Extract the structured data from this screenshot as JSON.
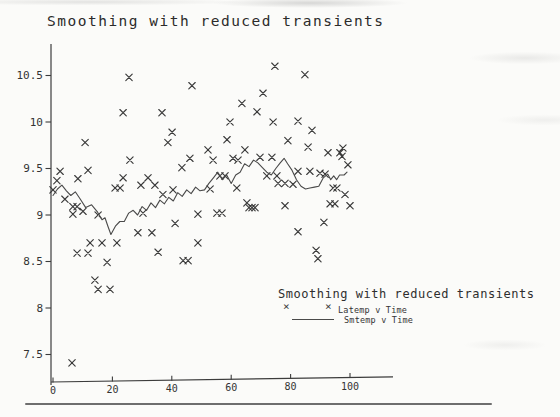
{
  "title": "Smoothing with reduced transients",
  "icons": {
    "x_marker_glyph": "×"
  },
  "colors": {
    "paper": "#fbfbf9",
    "ink": "#2b2b2b",
    "axis": "#3c3c3c",
    "marker": "#3a3a3a",
    "line": "#4a4a4a",
    "page_rule": "#6e6e6e"
  },
  "chart_data": {
    "type": "scatter",
    "title": "Smoothing with reduced transients",
    "xlabel": "",
    "ylabel": "",
    "xlim": [
      0,
      114
    ],
    "ylim": [
      7.2,
      10.95
    ],
    "x_ticks": [
      0,
      20,
      40,
      60,
      80,
      100
    ],
    "y_ticks": [
      7.5,
      8,
      8.5,
      9,
      9.5,
      10,
      10.5
    ],
    "grid": false,
    "legend": {
      "position": "inside-bottom-right",
      "title": "Smoothing with reduced transients",
      "entries": [
        {
          "label": "Latemp v Time",
          "type": "scatter",
          "marker": "x"
        },
        {
          "label": "Smtemp v Time",
          "type": "line"
        }
      ]
    },
    "series": [
      {
        "name": "Latemp v Time",
        "type": "scatter",
        "marker": "x",
        "points": [
          [
            0,
            9.27
          ],
          [
            1.3,
            9.37
          ],
          [
            2.4,
            9.47
          ],
          [
            4,
            9.17
          ],
          [
            6.4,
            7.41
          ],
          [
            6.7,
            9.09
          ],
          [
            6.7,
            9.01
          ],
          [
            8.1,
            9.09
          ],
          [
            8.1,
            8.59
          ],
          [
            8.4,
            9.39
          ],
          [
            10.1,
            9.04
          ],
          [
            10.8,
            9.78
          ],
          [
            11.8,
            9.48
          ],
          [
            11.8,
            8.59
          ],
          [
            12.5,
            8.7
          ],
          [
            14.1,
            8.3
          ],
          [
            15.2,
            9
          ],
          [
            15.2,
            8.2
          ],
          [
            16.5,
            8.7
          ],
          [
            18.2,
            8.49
          ],
          [
            19.2,
            8.2
          ],
          [
            20.9,
            9.29
          ],
          [
            21.5,
            8.7
          ],
          [
            22.6,
            9.29
          ],
          [
            23.6,
            10.1
          ],
          [
            23.6,
            9.4
          ],
          [
            25.6,
            10.48
          ],
          [
            25.9,
            9.59
          ],
          [
            28.6,
            8.81
          ],
          [
            29.6,
            9.32
          ],
          [
            30.3,
            9.02
          ],
          [
            32,
            9.4
          ],
          [
            33.3,
            8.81
          ],
          [
            34.3,
            9.32
          ],
          [
            35.4,
            8.6
          ],
          [
            36.7,
            10.1
          ],
          [
            37,
            9.22
          ],
          [
            38.7,
            9.78
          ],
          [
            40.1,
            9.89
          ],
          [
            40.4,
            9.27
          ],
          [
            41.1,
            8.91
          ],
          [
            43.4,
            9.51
          ],
          [
            43.8,
            8.51
          ],
          [
            45.5,
            8.51
          ],
          [
            46.1,
            9.61
          ],
          [
            46.8,
            10.39
          ],
          [
            48.8,
            9.01
          ],
          [
            48.8,
            8.7
          ],
          [
            52.2,
            9.7
          ],
          [
            52.9,
            9.28
          ],
          [
            53.9,
            9.59
          ],
          [
            55.2,
            9.02
          ],
          [
            56.2,
            9.42
          ],
          [
            56.9,
            9.02
          ],
          [
            57.9,
            9.42
          ],
          [
            58.6,
            9.81
          ],
          [
            59.6,
            10
          ],
          [
            60.6,
            9.61
          ],
          [
            61.9,
            9.29
          ],
          [
            62.3,
            9.59
          ],
          [
            63.6,
            10.2
          ],
          [
            64.6,
            9.7
          ],
          [
            65.3,
            9.13
          ],
          [
            66,
            9.08
          ],
          [
            67,
            9.08
          ],
          [
            68,
            9.08
          ],
          [
            68.7,
            10.11
          ],
          [
            69.7,
            9.62
          ],
          [
            70.7,
            10.31
          ],
          [
            72,
            9.42
          ],
          [
            73.7,
            9.62
          ],
          [
            74.1,
            10
          ],
          [
            74.7,
            10.6
          ],
          [
            75.4,
            9.42
          ],
          [
            75.8,
            9.34
          ],
          [
            78.1,
            9.34
          ],
          [
            78.1,
            9.1
          ],
          [
            79.1,
            9.8
          ],
          [
            80.8,
            9.33
          ],
          [
            82.5,
            10.01
          ],
          [
            82.5,
            9.47
          ],
          [
            82.5,
            8.82
          ],
          [
            84.8,
            10.51
          ],
          [
            85.9,
            9.73
          ],
          [
            86.5,
            9.47
          ],
          [
            87.2,
            9.91
          ],
          [
            88.6,
            8.62
          ],
          [
            89.2,
            8.53
          ],
          [
            89.9,
            9.45
          ],
          [
            91.2,
            8.92
          ],
          [
            91.6,
            9.44
          ],
          [
            92.6,
            9.67
          ],
          [
            93.3,
            9.12
          ],
          [
            94.3,
            9.29
          ],
          [
            94.9,
            9.12
          ],
          [
            95.6,
            9.29
          ],
          [
            96.6,
            9.67
          ],
          [
            97.3,
            9.63
          ],
          [
            97.6,
            9.72
          ],
          [
            98.3,
            9.22
          ],
          [
            99.3,
            9.54
          ],
          [
            100,
            9.1
          ]
        ]
      },
      {
        "name": "Smtemp v Time",
        "type": "line",
        "points": [
          [
            0,
            9.21
          ],
          [
            1.5,
            9.28
          ],
          [
            3,
            9.32
          ],
          [
            4.5,
            9.26
          ],
          [
            6,
            9.21
          ],
          [
            7.5,
            9.25
          ],
          [
            9,
            9.18
          ],
          [
            11,
            9.08
          ],
          [
            13,
            9.11
          ],
          [
            15,
            9.03
          ],
          [
            16.5,
            8.95
          ],
          [
            17.5,
            8.97
          ],
          [
            18.5,
            8.88
          ],
          [
            19.5,
            8.79
          ],
          [
            21,
            8.88
          ],
          [
            22.5,
            8.93
          ],
          [
            24,
            8.93
          ],
          [
            25.5,
            9.02
          ],
          [
            27,
            9.05
          ],
          [
            28.5,
            9
          ],
          [
            30,
            9.09
          ],
          [
            31.5,
            9.05
          ],
          [
            33,
            9.13
          ],
          [
            34.5,
            9.08
          ],
          [
            36,
            9.16
          ],
          [
            37.5,
            9.12
          ],
          [
            39,
            9.19
          ],
          [
            40.5,
            9.15
          ],
          [
            42,
            9.24
          ],
          [
            43.5,
            9.2
          ],
          [
            45,
            9.27
          ],
          [
            46.5,
            9.23
          ],
          [
            48,
            9.3
          ],
          [
            49.5,
            9.26
          ],
          [
            51,
            9.27
          ],
          [
            52.5,
            9.34
          ],
          [
            54,
            9.4
          ],
          [
            55.5,
            9.46
          ],
          [
            57,
            9.38
          ],
          [
            58.5,
            9.43
          ],
          [
            60,
            9.34
          ],
          [
            61.5,
            9.43
          ],
          [
            63,
            9.46
          ],
          [
            64.5,
            9.55
          ],
          [
            66,
            9.52
          ],
          [
            67.5,
            9.59
          ],
          [
            69,
            9.56
          ],
          [
            70.5,
            9.51
          ],
          [
            72,
            9.46
          ],
          [
            73.5,
            9.43
          ],
          [
            75,
            9.5
          ],
          [
            76.5,
            9.56
          ],
          [
            77.8,
            9.61
          ],
          [
            79,
            9.55
          ],
          [
            80.5,
            9.48
          ],
          [
            82,
            9.38
          ],
          [
            83.5,
            9.31
          ],
          [
            85,
            9.28
          ],
          [
            86.5,
            9.29
          ],
          [
            88,
            9.3
          ],
          [
            89.5,
            9.31
          ],
          [
            91,
            9.4
          ],
          [
            92.5,
            9.44
          ],
          [
            93.5,
            9.38
          ],
          [
            94.5,
            9.42
          ],
          [
            95.5,
            9.38
          ],
          [
            96.5,
            9.43
          ],
          [
            98,
            9.43
          ],
          [
            99,
            9.46
          ]
        ]
      }
    ]
  }
}
